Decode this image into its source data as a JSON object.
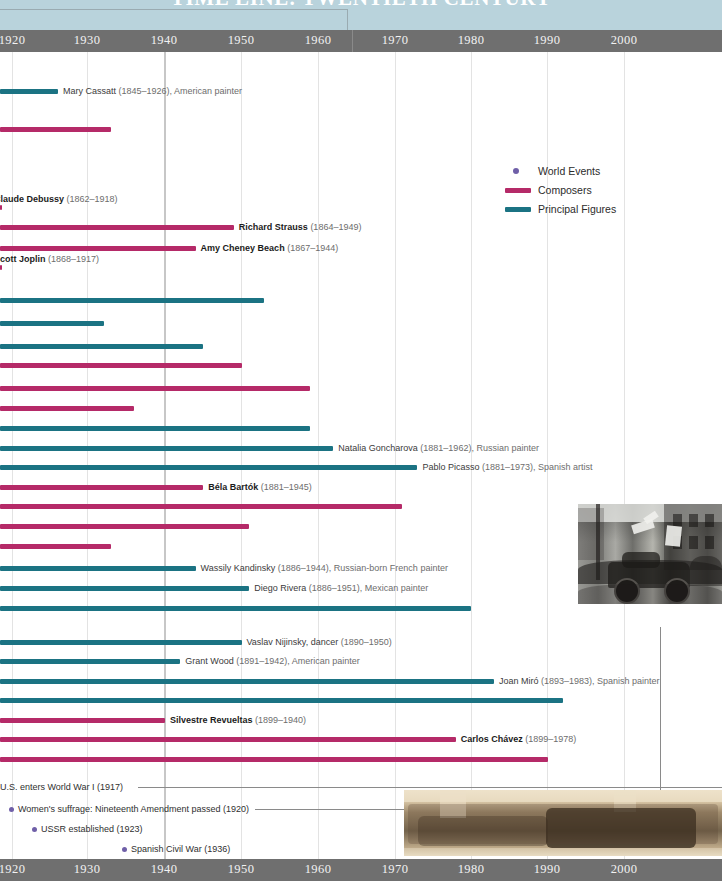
{
  "header": {
    "title": "TIME LINE: TWENTIETH CENTURY",
    "band_color": "#b9d3dc"
  },
  "axis": {
    "ticks": [
      "1920",
      "1930",
      "1940",
      "1950",
      "1960",
      "1970",
      "1980",
      "1990",
      "2000"
    ],
    "tick_x": [
      12,
      87,
      164,
      241,
      318,
      395,
      471,
      547,
      624
    ],
    "bar_color": "#6f6f6f"
  },
  "legend": {
    "items": [
      {
        "label": "World Events",
        "color": "#6f5fa8",
        "shape": "dot"
      },
      {
        "label": "Composers",
        "color": "#b52a68",
        "shape": "bar"
      },
      {
        "label": "Principal Figures",
        "color": "#1b7383",
        "shape": "bar"
      }
    ]
  },
  "colors": {
    "composer": "#b52a68",
    "figure": "#1b7383",
    "world_event": "#6f5fa8",
    "grid": "#e3e3e3",
    "grid_major": "#c7c7c7"
  },
  "chart_data": {
    "type": "bar",
    "title": "TIME LINE: TWENTIETH CENTURY",
    "xlabel": "",
    "ylabel": "",
    "xlim": [
      1920,
      2005
    ],
    "grid": true,
    "legend_position": "upper-right",
    "note": "Horizontal lifespan bars; all bars extend off the left edge of the visible crop (births predate 1920). End year = right end of bar.",
    "categories": [
      "Mary Cassatt",
      "Unnamed composer A",
      "Claude Debussy",
      "Richard Strauss",
      "Amy Cheney Beach",
      "Scott Joplin",
      "Unnamed figure B",
      "Unnamed figure C",
      "Unnamed figure D",
      "Unnamed composer E",
      "Unnamed composer F",
      "Unnamed composer G",
      "Unnamed figure H",
      "Natalia Goncharova",
      "Pablo Picasso",
      "Béla Bartók",
      "Unnamed composer I",
      "Unnamed composer J",
      "Unnamed composer K",
      "Wassily Kandinsky",
      "Diego Rivera",
      "Unnamed figure L",
      "Vaslav Nijinsky",
      "Grant Wood",
      "Joan Miró",
      "Unnamed figure M",
      "Silvestre Revueltas",
      "Carlos Chávez",
      "Unnamed composer N"
    ],
    "rows": [
      {
        "name": "Mary Cassatt",
        "suffix": "(1845–1926), American painter",
        "bold": false,
        "series": "Principal Figures",
        "end": 1926,
        "label_side": "right",
        "y": 32
      },
      {
        "name": "",
        "suffix": "",
        "bold": false,
        "series": "Composers",
        "end": 1933,
        "label_side": "none",
        "y": 70
      },
      {
        "name": "Claude Debussy",
        "suffix": "(1862–1918)",
        "bold": true,
        "series": "Composers",
        "end": 1918,
        "label_side": "left-inline",
        "y": 148
      },
      {
        "name": "Richard Strauss",
        "suffix": "(1864–1949)",
        "bold": true,
        "series": "Composers",
        "end": 1949,
        "label_side": "right",
        "y": 168
      },
      {
        "name": "Amy Cheney Beach",
        "suffix": "(1867–1944)",
        "bold": true,
        "series": "Composers",
        "end": 1944,
        "label_side": "right",
        "y": 189
      },
      {
        "name": "Scott Joplin",
        "suffix": "(1868–1917)",
        "bold": true,
        "series": "Composers",
        "end": 1917,
        "label_side": "left-inline",
        "y": 208
      },
      {
        "name": "",
        "suffix": "",
        "bold": false,
        "series": "Principal Figures",
        "end": 1953,
        "label_side": "none",
        "y": 241
      },
      {
        "name": "",
        "suffix": "",
        "bold": false,
        "series": "Principal Figures",
        "end": 1932,
        "label_side": "none",
        "y": 264
      },
      {
        "name": "",
        "suffix": "",
        "bold": false,
        "series": "Principal Figures",
        "end": 1945,
        "label_side": "none",
        "y": 287
      },
      {
        "name": "",
        "suffix": "",
        "bold": false,
        "series": "Composers",
        "end": 1950,
        "label_side": "none",
        "y": 306
      },
      {
        "name": "",
        "suffix": "",
        "bold": false,
        "series": "Composers",
        "end": 1959,
        "label_side": "none",
        "y": 329
      },
      {
        "name": "",
        "suffix": "",
        "bold": false,
        "series": "Composers",
        "end": 1936,
        "label_side": "none",
        "y": 349
      },
      {
        "name": "",
        "suffix": "",
        "bold": false,
        "series": "Principal Figures",
        "end": 1959,
        "label_side": "none",
        "y": 369
      },
      {
        "name": "Natalia Goncharova",
        "suffix": "(1881–1962), Russian painter",
        "bold": false,
        "series": "Principal Figures",
        "end": 1962,
        "label_side": "right",
        "y": 389
      },
      {
        "name": "Pablo Picasso",
        "suffix": "(1881–1973), Spanish artist",
        "bold": false,
        "series": "Principal Figures",
        "end": 1973,
        "label_side": "right",
        "y": 408
      },
      {
        "name": "Béla Bartók",
        "suffix": "(1881–1945)",
        "bold": true,
        "series": "Composers",
        "end": 1945,
        "label_side": "right",
        "y": 428
      },
      {
        "name": "",
        "suffix": "",
        "bold": false,
        "series": "Composers",
        "end": 1971,
        "label_side": "none",
        "y": 447
      },
      {
        "name": "",
        "suffix": "",
        "bold": false,
        "series": "Composers",
        "end": 1951,
        "label_side": "none",
        "y": 467
      },
      {
        "name": "",
        "suffix": "",
        "bold": false,
        "series": "Composers",
        "end": 1933,
        "label_side": "none",
        "y": 487
      },
      {
        "name": "Wassily Kandinsky",
        "suffix": "(1886–1944), Russian-born French painter",
        "bold": false,
        "series": "Principal Figures",
        "end": 1944,
        "label_side": "right",
        "y": 509
      },
      {
        "name": "Diego Rivera",
        "suffix": "(1886–1951), Mexican painter",
        "bold": false,
        "series": "Principal Figures",
        "end": 1951,
        "label_side": "right",
        "y": 529
      },
      {
        "name": "",
        "suffix": "",
        "bold": false,
        "series": "Principal Figures",
        "end": 1980,
        "label_side": "none",
        "y": 549
      },
      {
        "name": "Vaslav Nijinsky, dancer",
        "suffix": "(1890–1950)",
        "bold": false,
        "series": "Principal Figures",
        "end": 1950,
        "label_side": "right",
        "y": 583
      },
      {
        "name": "Grant Wood",
        "suffix": "(1891–1942), American painter",
        "bold": false,
        "series": "Principal Figures",
        "end": 1942,
        "label_side": "right",
        "y": 602
      },
      {
        "name": "Joan Miró",
        "suffix": "(1893–1983), Spanish painter",
        "bold": false,
        "series": "Principal Figures",
        "end": 1983,
        "label_side": "right",
        "y": 622
      },
      {
        "name": "",
        "suffix": "",
        "bold": false,
        "series": "Principal Figures",
        "end": 1992,
        "label_side": "none",
        "y": 641
      },
      {
        "name": "Silvestre Revueltas",
        "suffix": "(1899–1940)",
        "bold": true,
        "series": "Composers",
        "end": 1940,
        "label_side": "right",
        "y": 661
      },
      {
        "name": "Carlos Chávez",
        "suffix": "(1899–1978)",
        "bold": true,
        "series": "Composers",
        "end": 1978,
        "label_side": "right",
        "y": 680
      },
      {
        "name": "",
        "suffix": "",
        "bold": false,
        "series": "Composers",
        "end": 1990,
        "label_side": "none",
        "y": 700
      }
    ],
    "world_events": [
      {
        "label": "U.S. enters World War I (1917)",
        "year": 1917,
        "x": 0,
        "y": 728,
        "leader": 295
      },
      {
        "label": "Women's suffrage: Nineteenth Amendment passed (1920)",
        "year": 1920,
        "x": 9,
        "y": 750,
        "leader": 205
      },
      {
        "label": "USSR established (1923)",
        "year": 1923,
        "x": 32,
        "y": 770,
        "leader": 0
      },
      {
        "label": "Spanish Civil War (1936)",
        "year": 1936,
        "x": 122,
        "y": 790,
        "leader": 0
      }
    ]
  },
  "photos": [
    {
      "name": "street-scene-photo",
      "caption": "",
      "tone": "black-and-white"
    },
    {
      "name": "group-portrait-photo",
      "caption": "",
      "tone": "sepia"
    }
  ]
}
